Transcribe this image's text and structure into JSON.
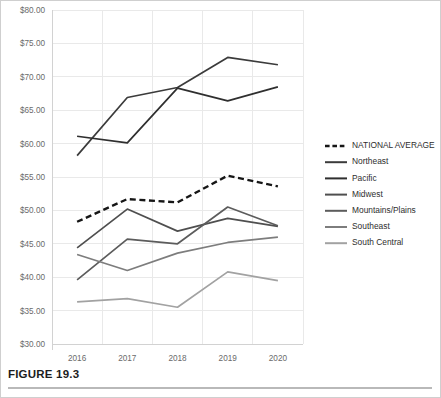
{
  "figure": {
    "caption": "FIGURE 19.3"
  },
  "chart_data": {
    "type": "line",
    "title": "",
    "xlabel": "",
    "ylabel": "",
    "categories": [
      "2016",
      "2017",
      "2018",
      "2019",
      "2020"
    ],
    "x": [
      2016,
      2017,
      2018,
      2019,
      2020
    ],
    "ylim": [
      30,
      80
    ],
    "ytick_values": [
      30,
      35,
      40,
      45,
      50,
      55,
      60,
      65,
      70,
      75,
      80
    ],
    "ytick_labels": [
      "$30.00",
      "$35.00",
      "$40.00",
      "$45.00",
      "$50.00",
      "$55.00",
      "$60.00",
      "$65.00",
      "$70.00",
      "$75.00",
      "$80.00"
    ],
    "grid": true,
    "legend_position": "right",
    "series": [
      {
        "name": "NATIONAL AVERAGE",
        "color": "#161616",
        "style": "dashed",
        "values": [
          48.3,
          51.7,
          51.2,
          55.2,
          53.6
        ]
      },
      {
        "name": "Northeast",
        "color": "#3b3b3b",
        "style": "solid",
        "values": [
          58.2,
          66.9,
          68.4,
          72.9,
          71.8
        ]
      },
      {
        "name": "Pacific",
        "color": "#2f2f2f",
        "style": "solid",
        "values": [
          61.1,
          60.1,
          68.3,
          66.4,
          68.5
        ]
      },
      {
        "name": "Midwest",
        "color": "#4f4f4f",
        "style": "solid",
        "values": [
          44.4,
          50.2,
          46.9,
          48.8,
          47.6
        ]
      },
      {
        "name": "Mountains/Plains",
        "color": "#5c5c5c",
        "style": "solid",
        "values": [
          39.6,
          45.7,
          45.0,
          50.5,
          47.7
        ]
      },
      {
        "name": "Southeast",
        "color": "#7d7d7d",
        "style": "solid",
        "values": [
          43.4,
          41.0,
          43.6,
          45.2,
          46.0
        ]
      },
      {
        "name": "South Central",
        "color": "#a2a2a2",
        "style": "solid",
        "values": [
          36.3,
          36.8,
          35.5,
          40.8,
          39.5
        ]
      }
    ]
  }
}
